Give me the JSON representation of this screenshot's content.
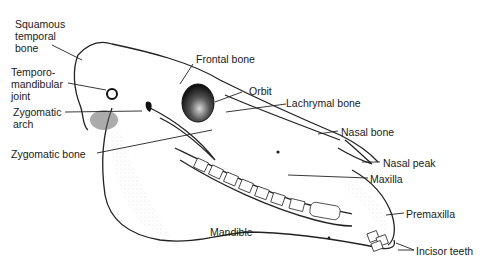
{
  "diagram": {
    "labels": {
      "squamous_temporal": [
        "Squamous",
        "temporal",
        "bone"
      ],
      "temporomandibular": [
        "Temporo-",
        "mandibular",
        "joint"
      ],
      "zygomatic_arch": [
        "Zygomatic",
        "arch"
      ],
      "zygomatic_bone": "Zygomatic bone",
      "frontal_bone": "Frontal bone",
      "orbit": "Orbit",
      "lachrymal_bone": "Lachrymal bone",
      "nasal_bone": "Nasal bone",
      "nasal_peak": "Nasal peak",
      "maxilla": "Maxilla",
      "premaxilla": "Premaxilla",
      "mandible": "Mandible",
      "incisor_teeth": "Incisor teeth"
    }
  }
}
